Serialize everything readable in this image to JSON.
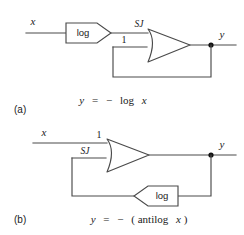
{
  "figure": {
    "background_color": "#ffffff",
    "line_color": "#4a4a4a",
    "text_color": "#1a1a1a",
    "node_color": "#111111"
  },
  "panels": [
    {
      "id": "a",
      "part_label": "(a)",
      "equation": "y = − log x",
      "equation_parts": {
        "output_var": "y",
        "equals": "=",
        "sign": "−",
        "function": "log",
        "input_var": "x"
      },
      "input_label": "x",
      "output_label": "y",
      "amplifier": {
        "top_input_label": "SJ",
        "bottom_input_label": "1",
        "top_input_meaning": "summing-junction",
        "bottom_input_meaning": "unity-gain-input"
      },
      "forward_block": {
        "label": "log",
        "orientation": "points-right",
        "path": "forward"
      },
      "feedback_block": null,
      "feedback_path": "output node routed down and back to the unity-gain input"
    },
    {
      "id": "b",
      "part_label": "(b)",
      "equation": "y = − (antilog x)",
      "equation_parts": {
        "output_var": "y",
        "equals": "=",
        "sign": "−",
        "open_paren": "(",
        "function": "antilog",
        "input_var": "x",
        "close_paren": ")"
      },
      "input_label": "x",
      "output_label": "y",
      "amplifier": {
        "top_input_label": "1",
        "bottom_input_label": "SJ",
        "top_input_meaning": "unity-gain-input",
        "bottom_input_meaning": "summing-junction"
      },
      "forward_block": null,
      "feedback_block": {
        "label": "log",
        "orientation": "points-left",
        "path": "feedback"
      },
      "feedback_path": "output node routed down through the log block and back to the summing junction"
    }
  ]
}
